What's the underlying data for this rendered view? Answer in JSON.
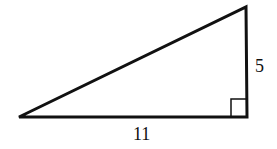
{
  "diagram": {
    "type": "right-triangle",
    "stroke_color": "#111111",
    "vertices": {
      "left": [
        19,
        117
      ],
      "top_right": [
        246,
        7
      ],
      "right_angle": [
        247,
        117
      ]
    },
    "right_angle_marker": true,
    "labels": {
      "vertical_leg": "5",
      "horizontal_leg": "11"
    }
  }
}
